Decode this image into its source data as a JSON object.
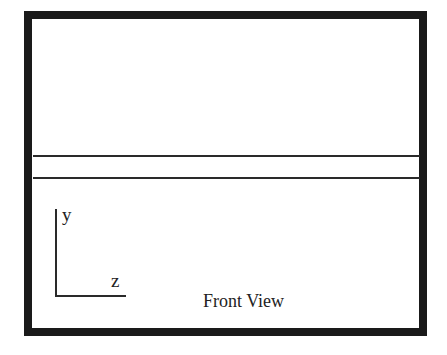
{
  "diagram": {
    "view_title": "Front View",
    "axes": {
      "vertical_label": "y",
      "horizontal_label": "z"
    },
    "elements": [
      {
        "type": "frame",
        "description": "thick black rectangular border"
      },
      {
        "type": "horizontal-line",
        "position": "upper"
      },
      {
        "type": "horizontal-line",
        "position": "lower"
      }
    ],
    "colors": {
      "border": "#1a1a1a",
      "lines": "#2a2a2a",
      "background": "#ffffff"
    }
  }
}
